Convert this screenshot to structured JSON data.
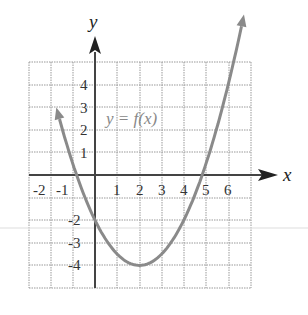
{
  "chart_data": {
    "type": "line",
    "title": "",
    "xlabel": "x",
    "ylabel": "y",
    "xlim": [
      -3,
      7
    ],
    "ylim": [
      -5,
      5
    ],
    "grid": true,
    "x_ticks": [
      "-2",
      "-1",
      "1",
      "2",
      "3",
      "4",
      "5",
      "6"
    ],
    "y_ticks": [
      "4",
      "3",
      "2",
      "1",
      "-2",
      "-3",
      "-4"
    ],
    "annotation": "y = f(x)",
    "series": [
      {
        "name": "y = f(x)",
        "function": "0.5*(x-2)^2 - 4",
        "x": [
          -1.7,
          -1,
          -0.83,
          0,
          1,
          2,
          3,
          4,
          4.83,
          5,
          6,
          6.7
        ],
        "y": [
          2.85,
          0.5,
          0,
          -2,
          -3.5,
          -4,
          -3.5,
          -2,
          0,
          0.5,
          4,
          7.05
        ],
        "color": "#8a8a8a"
      }
    ],
    "key_points": {
      "vertex": [
        2,
        -4
      ],
      "y_intercept": [
        0,
        -2
      ],
      "x_intercepts": [
        -0.83,
        4.83
      ]
    }
  }
}
